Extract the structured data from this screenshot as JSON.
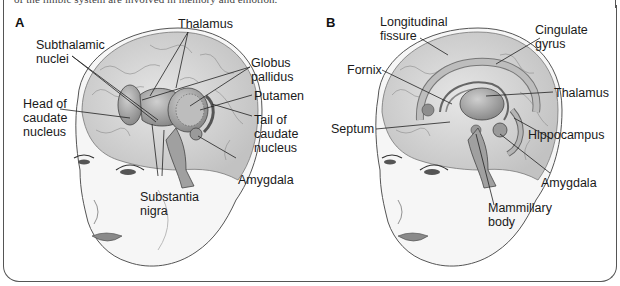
{
  "caption_fragment": "of the limbic system are involved in memory and emotion.",
  "panels": [
    {
      "letter": "A",
      "labels": {
        "thalamus": "Thalamus",
        "subthalamic_nuclei": "Subthalamic\nnuclei",
        "globus_pallidus": "Globus\npallidus",
        "head_of_caudate": "Head of\ncaudate\nnucleus",
        "putamen": "Putamen",
        "tail_of_caudate": "Tail of\ncaudate\nnucleus",
        "amygdala": "Amygdala",
        "substantia_nigra": "Substantia\nnigra"
      }
    },
    {
      "letter": "B",
      "labels": {
        "longitudinal_fissure": "Longitudinal\nfissure",
        "cingulate_gyrus": "Cingulate\ngyrus",
        "fornix": "Fornix",
        "thalamus": "Thalamus",
        "septum": "Septum",
        "hippocampus": "Hippocampus",
        "amygdala": "Amygdala",
        "mammillary_body": "Mammillary\nbody"
      }
    }
  ],
  "colors": {
    "brain_fill": "#d9d9d9",
    "structure_fill": "#a8a8a8",
    "line": "#333333",
    "skin": "#f4f4f4"
  }
}
